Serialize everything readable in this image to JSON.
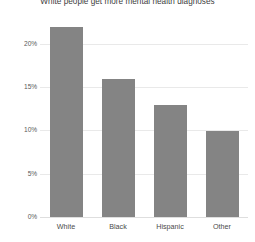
{
  "chart_data": {
    "type": "bar",
    "title": "White people get more mental health diagnoses",
    "xlabel": "",
    "ylabel": "",
    "categories": [
      "White",
      "Black",
      "Hispanic",
      "Other"
    ],
    "values": [
      22,
      16,
      13,
      10
    ],
    "value_labels": [
      "22%",
      "16%",
      "13%",
      "10%"
    ],
    "ytick_labels": [
      "20%",
      "15%",
      "10%",
      "5%",
      "0%"
    ],
    "ytick_values": [
      20,
      15,
      10,
      5,
      0
    ],
    "ylim": [
      0,
      21.5
    ],
    "grid": true,
    "legend": false,
    "series": [
      {
        "name": "Share receiving diagnosis",
        "values": [
          22,
          16,
          13,
          10
        ]
      }
    ],
    "colors": {
      "bar": "#848484",
      "gridline": "#e9e9e9",
      "baseline": "#dedede",
      "title_text": "#3d3d3d",
      "tick_text": "#5a5a5a",
      "category_text": "#4a4a4a",
      "background": "#ffffff"
    }
  }
}
